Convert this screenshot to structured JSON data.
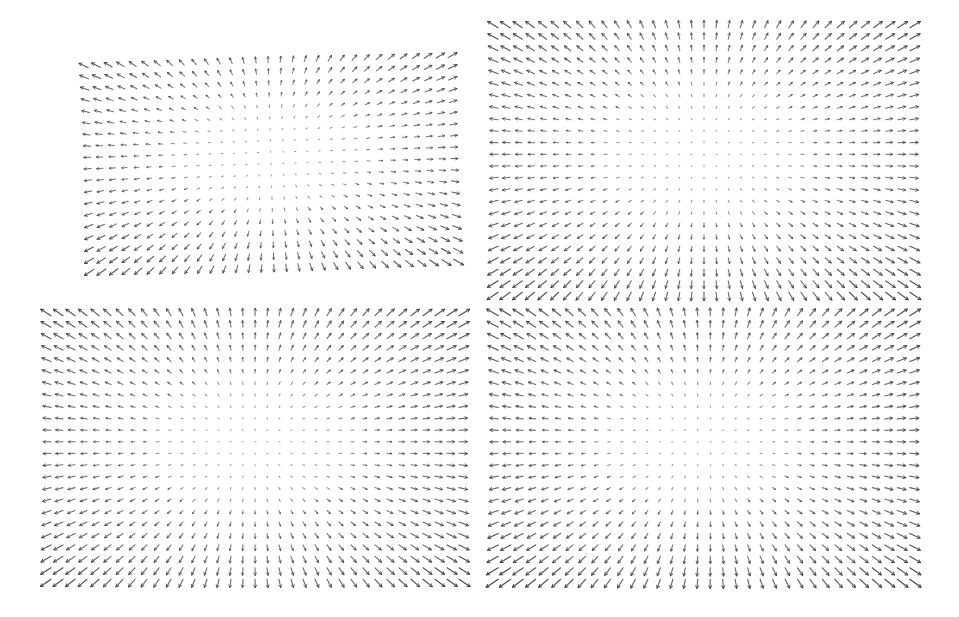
{
  "figure": {
    "type": "quiver-grid",
    "background_color": "#ffffff",
    "width": 959,
    "height": 617,
    "arrow_color": "#3a3a3a",
    "layout": "2x2 grid of vector-field (quiver) plots"
  },
  "chart_data": [
    {
      "type": "scatter",
      "name": "panel-top-left",
      "title": "",
      "subtitle": "",
      "xlabel": "",
      "ylabel": "",
      "plot_kind": "quiver",
      "grid": false,
      "legend": null,
      "annotations": [],
      "tick_labels": {
        "x": [],
        "y": []
      },
      "xlim": [
        -1,
        1
      ],
      "ylim": [
        -1,
        1
      ],
      "pixel_box": {
        "x": 85,
        "y": 57,
        "width": 372,
        "height": 213
      },
      "rotation_deg": -1.6,
      "cols": 31,
      "rows": 19,
      "field": "radial-source",
      "center": [
        0.5,
        0.46
      ],
      "core_radius": 0.1,
      "max_len": 11.5,
      "min_len": 1.2,
      "arrow_color": "#3f3f3f",
      "line_width": 1.05,
      "notes": "Arrows radiate outward from an interior stagnation point; magnitude grows with distance from centre, largest near the four corners."
    },
    {
      "type": "scatter",
      "name": "panel-top-right",
      "title": "",
      "subtitle": "",
      "xlabel": "",
      "ylabel": "",
      "plot_kind": "quiver",
      "grid": false,
      "legend": null,
      "annotations": [],
      "tick_labels": {
        "x": [],
        "y": []
      },
      "xlim": [
        -1,
        1
      ],
      "ylim": [
        -1,
        1
      ],
      "pixel_box": {
        "x": 492,
        "y": 22,
        "width": 424,
        "height": 276
      },
      "rotation_deg": 0,
      "cols": 35,
      "rows": 24,
      "field": "radial-source",
      "center": [
        0.5,
        0.47
      ],
      "core_radius": 0.09,
      "max_len": 13.5,
      "min_len": 1.0,
      "arrow_color": "#3a3a3a",
      "line_width": 1.1,
      "notes": "Same radial source pattern rendered on a denser grid; strong left/right horizontal streaks at mid-height and long diagonals in the corners."
    },
    {
      "type": "scatter",
      "name": "panel-bottom-left",
      "title": "",
      "subtitle": "",
      "xlabel": "",
      "ylabel": "",
      "plot_kind": "quiver",
      "grid": false,
      "legend": null,
      "annotations": [],
      "tick_labels": {
        "x": [],
        "y": []
      },
      "xlim": [
        -1,
        1
      ],
      "ylim": [
        -1,
        1
      ],
      "pixel_box": {
        "x": 45,
        "y": 310,
        "width": 420,
        "height": 275
      },
      "rotation_deg": 0,
      "cols": 35,
      "rows": 24,
      "field": "radial-source",
      "center": [
        0.49,
        0.48
      ],
      "core_radius": 0.09,
      "max_len": 13.5,
      "min_len": 1.0,
      "arrow_color": "#3a3a3a",
      "line_width": 1.1,
      "notes": "Radial source field, near-identical to the top-right panel."
    },
    {
      "type": "scatter",
      "name": "panel-bottom-right",
      "title": "",
      "subtitle": "",
      "xlabel": "",
      "ylabel": "",
      "plot_kind": "quiver",
      "grid": false,
      "legend": null,
      "annotations": [],
      "tick_labels": {
        "x": [],
        "y": []
      },
      "xlim": [
        -1,
        1
      ],
      "ylim": [
        -1,
        1
      ],
      "pixel_box": {
        "x": 492,
        "y": 310,
        "width": 424,
        "height": 275
      },
      "rotation_deg": 0,
      "cols": 34,
      "rows": 24,
      "field": "radial-source-skewed",
      "center": [
        0.52,
        0.47
      ],
      "core_radius": 0.09,
      "max_len": 14.5,
      "min_len": 1.0,
      "arrow_color": "#3a3a3a",
      "line_width": 1.15,
      "notes": "Radial source with a slightly off-centre focus; the upper-left quadrant shows the longest, densest diagonal arrows."
    }
  ],
  "panels": {
    "count": 4,
    "order": [
      "panel-top-left",
      "panel-top-right",
      "panel-bottom-left",
      "panel-bottom-right"
    ]
  }
}
